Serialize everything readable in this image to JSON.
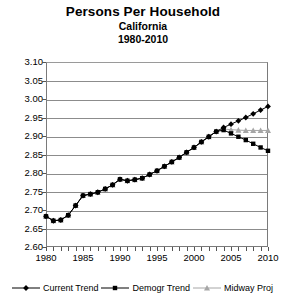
{
  "title": {
    "main": "Persons Per Household",
    "line2": "California",
    "line3": "1980-2010"
  },
  "legend": {
    "position": "bottom",
    "items": [
      {
        "label": "Current Trend",
        "marker": "diamond-marker-icon",
        "color": "#000000"
      },
      {
        "label": "Demogr Trend",
        "marker": "square-marker-icon",
        "color": "#000000"
      },
      {
        "label": "Midway Proj",
        "marker": "triangle-marker-icon",
        "color": "#a6a6a6"
      }
    ]
  },
  "axes": {
    "y_ticks": [
      "3.10",
      "3.05",
      "3.00",
      "2.95",
      "2.90",
      "2.85",
      "2.80",
      "2.75",
      "2.70",
      "2.65",
      "2.60"
    ],
    "x_ticks": [
      "1980",
      "1985",
      "1990",
      "1995",
      "2000",
      "2005",
      "2010"
    ]
  },
  "chart_data": {
    "type": "line",
    "title": "Persons Per Household",
    "subtitle": "California 1980-2010",
    "xlabel": "",
    "ylabel": "",
    "xlim": [
      1980,
      2010
    ],
    "ylim": [
      2.6,
      3.1
    ],
    "ytick_step": 0.05,
    "xtick_step": 5,
    "minor_xtick_step": 1,
    "grid": "horizontal",
    "legend_position": "bottom",
    "x": [
      1980,
      1981,
      1982,
      1983,
      1984,
      1985,
      1986,
      1987,
      1988,
      1989,
      1990,
      1991,
      1992,
      1993,
      1994,
      1995,
      1996,
      1997,
      1998,
      1999,
      2000,
      2001,
      2002,
      2003,
      2004,
      2005,
      2006,
      2007,
      2008,
      2009,
      2010
    ],
    "series": [
      {
        "name": "Current Trend",
        "marker": "diamond",
        "color": "#000000",
        "values": [
          2.683,
          2.671,
          2.673,
          2.686,
          2.712,
          2.739,
          2.743,
          2.748,
          2.757,
          2.768,
          2.783,
          2.779,
          2.782,
          2.786,
          2.796,
          2.806,
          2.818,
          2.83,
          2.842,
          2.856,
          2.869,
          2.884,
          2.898,
          2.912,
          2.923,
          2.932,
          2.941,
          2.95,
          2.96,
          2.97,
          2.98
        ]
      },
      {
        "name": "Demogr Trend",
        "marker": "square",
        "color": "#000000",
        "values": [
          2.683,
          2.671,
          2.673,
          2.686,
          2.712,
          2.739,
          2.743,
          2.748,
          2.757,
          2.768,
          2.783,
          2.779,
          2.782,
          2.786,
          2.796,
          2.806,
          2.818,
          2.83,
          2.842,
          2.856,
          2.869,
          2.884,
          2.898,
          2.912,
          2.916,
          2.907,
          2.898,
          2.889,
          2.879,
          2.869,
          2.86
        ]
      },
      {
        "name": "Midway Proj",
        "marker": "triangle",
        "color": "#a6a6a6",
        "values": [
          2.683,
          2.671,
          2.673,
          2.686,
          2.712,
          2.739,
          2.743,
          2.748,
          2.757,
          2.768,
          2.783,
          2.779,
          2.782,
          2.786,
          2.796,
          2.806,
          2.818,
          2.83,
          2.842,
          2.856,
          2.869,
          2.884,
          2.898,
          2.912,
          2.919,
          2.917,
          2.916,
          2.915,
          2.915,
          2.915,
          2.915
        ]
      }
    ]
  }
}
